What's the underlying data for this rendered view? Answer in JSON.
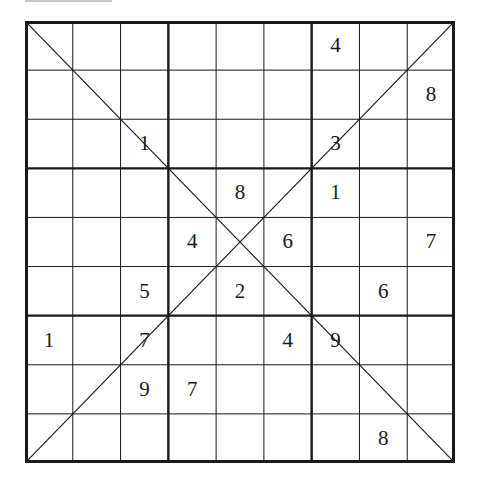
{
  "puzzle": {
    "type": "X-Sudoku",
    "size": 9,
    "box_size": 3,
    "diagonals": true,
    "grid": [
      [
        "",
        "",
        "",
        "",
        "",
        "",
        "4",
        "",
        ""
      ],
      [
        "",
        "",
        "",
        "",
        "",
        "",
        "",
        "",
        "8"
      ],
      [
        "",
        "",
        "1",
        "",
        "",
        "",
        "3",
        "",
        ""
      ],
      [
        "",
        "",
        "",
        "",
        "8",
        "",
        "1",
        "",
        ""
      ],
      [
        "",
        "",
        "",
        "4",
        "",
        "6",
        "",
        "",
        "7"
      ],
      [
        "",
        "",
        "5",
        "",
        "2",
        "",
        "",
        "6",
        ""
      ],
      [
        "1",
        "",
        "7",
        "",
        "",
        "4",
        "9",
        "",
        ""
      ],
      [
        "",
        "",
        "9",
        "7",
        "",
        "",
        "",
        "",
        ""
      ],
      [
        "",
        "",
        "",
        "",
        "",
        "",
        "",
        "8",
        ""
      ]
    ]
  },
  "colors": {
    "line": "#1a1a1a",
    "digit": "#1a1a1a",
    "background": "#ffffff"
  }
}
